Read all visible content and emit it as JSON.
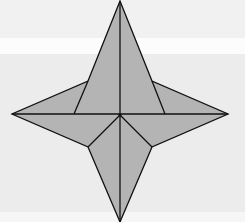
{
  "figure": {
    "title": "",
    "colors": {
      "background": "#f1f1f1",
      "band_top": "#f1f1f1",
      "band_white": "#fcfcfc",
      "band_lower": "#ececec",
      "fill": "#b4b4b4",
      "stroke": "#111111"
    },
    "points": {
      "top": [
        120,
        1
      ],
      "bottom": [
        120,
        222
      ],
      "left": [
        12,
        114
      ],
      "right": [
        228,
        114
      ],
      "center": [
        120,
        115
      ],
      "upper_left_notch": [
        88,
        81
      ],
      "upper_right_notch": [
        152,
        81
      ],
      "lower_left_notch": [
        88,
        147
      ],
      "lower_right_notch": [
        152,
        147
      ],
      "left_crease_base": [
        74,
        114
      ],
      "right_crease_base": [
        165,
        114
      ]
    }
  }
}
